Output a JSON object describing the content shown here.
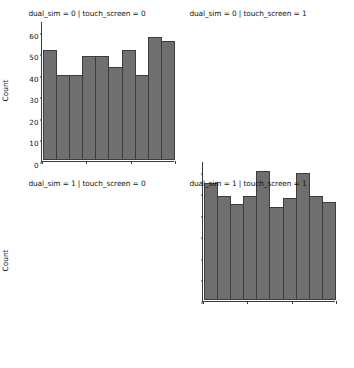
{
  "figure": {
    "background_color": "#ffffff",
    "bar_fill_color": "#6f6f6f",
    "bar_edge_color": "#3c3c3c",
    "axis_color": "#3a3a3a"
  },
  "chart_data": [
    {
      "type": "bar",
      "title": "dual_sim = 0 | touch_screen = 0",
      "xlabel": "battery_power",
      "ylabel": "Count",
      "xlim": [
        500,
        2000
      ],
      "ylim": [
        0,
        65
      ],
      "yticks": [
        0,
        10,
        20,
        30,
        40,
        50,
        60
      ],
      "xticks": [
        500,
        1000,
        1500,
        2000
      ],
      "grid": false,
      "legend": null,
      "bin_edges": [
        500,
        650,
        800,
        950,
        1100,
        1250,
        1400,
        1550,
        1700,
        1850,
        2000
      ],
      "categories": [
        "500-650",
        "650-800",
        "800-950",
        "950-1100",
        "1100-1250",
        "1250-1400",
        "1400-1550",
        "1550-1700",
        "1700-1850",
        "1850-2000"
      ],
      "values": [
        52,
        40,
        40,
        49,
        49,
        44,
        52,
        40,
        58,
        56
      ]
    },
    {
      "type": "bar",
      "title": "dual_sim = 0 | touch_screen = 1",
      "xlabel": "battery_power",
      "ylabel": "",
      "xlim": [
        500,
        2000
      ],
      "ylim": [
        0,
        65
      ],
      "yticks": [
        0,
        10,
        20,
        30,
        40,
        50,
        60
      ],
      "xticks": [
        500,
        1000,
        1500,
        2000
      ],
      "grid": false,
      "legend": null,
      "bin_edges": [
        500,
        650,
        800,
        950,
        1100,
        1250,
        1400,
        1550,
        1700,
        1850,
        2000
      ],
      "categories": [
        "500-650",
        "650-800",
        "800-950",
        "950-1100",
        "1100-1250",
        "1250-1400",
        "1400-1550",
        "1550-1700",
        "1700-1850",
        "1850-2000"
      ],
      "values": [
        55,
        49,
        45,
        49,
        61,
        44,
        48,
        60,
        49,
        46
      ]
    },
    {
      "type": "bar",
      "title": "dual_sim = 1 | touch_screen = 0",
      "xlabel": "battery_power",
      "ylabel": "Count",
      "xlim": [
        500,
        2000
      ],
      "ylim": [
        0,
        65
      ],
      "yticks": [
        0,
        10,
        20,
        30,
        40,
        50,
        60
      ],
      "xticks": [
        500,
        1000,
        1500,
        2000
      ],
      "grid": false,
      "legend": null,
      "bin_edges": [
        500,
        650,
        800,
        950,
        1100,
        1250,
        1400,
        1550,
        1700,
        1850,
        2000
      ],
      "categories": [
        "500-650",
        "650-800",
        "800-950",
        "950-1100",
        "1100-1250",
        "1250-1400",
        "1400-1550",
        "1550-1700",
        "1700-1850",
        "1850-2000"
      ],
      "values": [
        57,
        48,
        63,
        39,
        43,
        42,
        36,
        53,
        50,
        42
      ]
    },
    {
      "type": "bar",
      "title": "dual_sim = 1 | touch_screen = 1",
      "xlabel": "battery_power",
      "ylabel": "",
      "xlim": [
        500,
        2000
      ],
      "ylim": [
        0,
        65
      ],
      "yticks": [
        0,
        10,
        20,
        30,
        40,
        50,
        60
      ],
      "xticks": [
        500,
        1000,
        1500,
        2000
      ],
      "grid": false,
      "legend": null,
      "bin_edges": [
        500,
        650,
        800,
        950,
        1100,
        1250,
        1400,
        1550,
        1700,
        1850,
        2000
      ],
      "categories": [
        "500-650",
        "650-800",
        "800-950",
        "950-1100",
        "1100-1250",
        "1250-1400",
        "1400-1550",
        "1550-1700",
        "1700-1850",
        "1850-2000"
      ],
      "values": [
        56,
        61,
        60,
        52,
        36,
        61,
        44,
        40,
        50,
        54
      ]
    }
  ],
  "facets": [
    {
      "title": "dual_sim = 0 | touch_screen = 0",
      "ylabel": "Count",
      "xlabel": "battery_power",
      "show_ylabel": true,
      "show_yticklabels": true,
      "show_xticklabels": false,
      "show_xlabel": false
    },
    {
      "title": "dual_sim = 0 | touch_screen = 1",
      "ylabel": "",
      "xlabel": "battery_power",
      "show_ylabel": false,
      "show_yticklabels": false,
      "show_xticklabels": false,
      "show_xlabel": false
    },
    {
      "title": "dual_sim = 1 | touch_screen = 0",
      "ylabel": "Count",
      "xlabel": "battery_power",
      "show_ylabel": true,
      "show_yticklabels": true,
      "show_xticklabels": true,
      "show_xlabel": true
    },
    {
      "title": "dual_sim = 1 | touch_screen = 1",
      "ylabel": "",
      "xlabel": "battery_power",
      "show_ylabel": false,
      "show_yticklabels": false,
      "show_xticklabels": true,
      "show_xlabel": true
    }
  ],
  "axis_labels": {
    "yticks": [
      "0",
      "10",
      "20",
      "30",
      "40",
      "50",
      "60"
    ],
    "xticks": [
      "500",
      "1000",
      "1500",
      "2000"
    ]
  }
}
